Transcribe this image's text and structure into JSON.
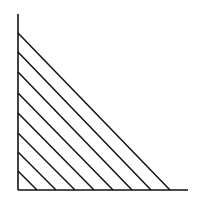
{
  "diagram": {
    "type": "string-art-parabolic-curve",
    "stroke_color": "#111111",
    "background": "#ffffff",
    "axes": {
      "origin": [
        18,
        190
      ],
      "y_axis_top": [
        18,
        14
      ],
      "x_axis_end": [
        188,
        190
      ]
    },
    "lines": [
      {
        "from": [
          18,
          33
        ],
        "to": [
          170,
          190
        ]
      },
      {
        "from": [
          18,
          52
        ],
        "to": [
          151,
          190
        ]
      },
      {
        "from": [
          18,
          72
        ],
        "to": [
          132,
          190
        ]
      },
      {
        "from": [
          18,
          93
        ],
        "to": [
          113,
          190
        ]
      },
      {
        "from": [
          18,
          113
        ],
        "to": [
          94,
          190
        ]
      },
      {
        "from": [
          18,
          133
        ],
        "to": [
          75,
          190
        ]
      },
      {
        "from": [
          18,
          152
        ],
        "to": [
          56,
          190
        ]
      },
      {
        "from": [
          18,
          171
        ],
        "to": [
          37,
          190
        ]
      }
    ]
  }
}
